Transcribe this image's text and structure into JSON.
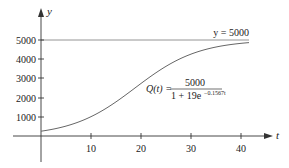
{
  "chart_data": {
    "type": "line",
    "title": "",
    "xlabel": "t",
    "ylabel": "y",
    "xlim": [
      -8,
      46
    ],
    "ylim": [
      -1250,
      6600
    ],
    "x_ticks": [
      10,
      20,
      30,
      40
    ],
    "x_tick_labels": [
      "10",
      "20",
      "30",
      "40"
    ],
    "y_ticks": [
      1000,
      2000,
      3000,
      4000,
      5000
    ],
    "y_tick_labels": [
      "1000",
      "2000",
      "3000",
      "4000",
      "5000"
    ],
    "grid": false,
    "legend": null,
    "series": [
      {
        "name": "Q(t) = 5000 / (1 + 19e^(-0.1567t))",
        "function": "5000/(1+19*exp(-0.1567*t))",
        "x": [
          0,
          5,
          10,
          15,
          20,
          25,
          30,
          35,
          40,
          41.5
        ],
        "values": [
          250,
          530,
          1073,
          1986,
          3177,
          4036,
          4522,
          4770,
          4893,
          4915
        ]
      },
      {
        "name": "y = 5000",
        "type": "horizontal_asymptote",
        "x": [
          0,
          41.5
        ],
        "values": [
          5000,
          5000
        ]
      }
    ],
    "annotations": [
      {
        "text": "y = 5000",
        "x": 38,
        "y": 5100
      },
      {
        "text": "Q(t) = 5000 / (1 + 19e^{-0.1567t})",
        "x": 22,
        "y": 2600
      }
    ]
  },
  "labels": {
    "y_axis": "y",
    "x_axis": "t",
    "asymptote": "y = 5000",
    "formula_lhs": "Q(t) =",
    "formula_numerator": "5000",
    "formula_denominator_base": "1 + 19e",
    "formula_exponent": "−0.1567t"
  }
}
